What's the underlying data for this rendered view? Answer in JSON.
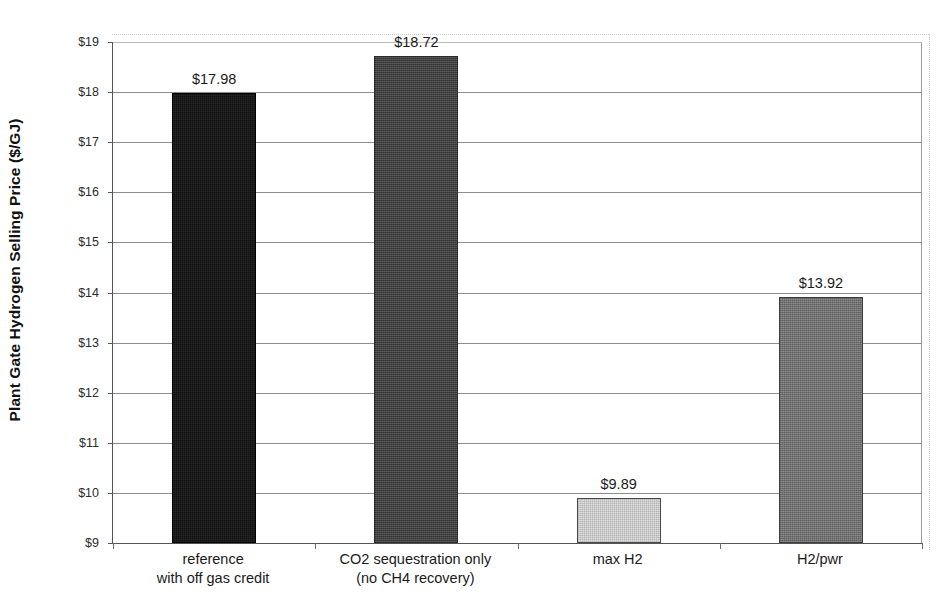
{
  "chart_data": {
    "type": "bar",
    "title": "",
    "subtitle": "",
    "xlabel": "",
    "ylabel": "Plant Gate Hydrogen Selling Price ($/GJ)",
    "categories": [
      "reference\nwith off gas credit",
      "CO2 sequestration only\n(no CH4 recovery)",
      "max H2",
      "H2/pwr"
    ],
    "values": [
      17.98,
      18.72,
      9.89,
      13.92
    ],
    "data_labels": [
      "$17.98",
      "$18.72",
      "$9.89",
      "$13.92"
    ],
    "ylim": [
      9,
      19
    ],
    "ytick_values": [
      9,
      10,
      11,
      12,
      13,
      14,
      15,
      16,
      17,
      18,
      19
    ],
    "ytick_labels": [
      "$9",
      "$10",
      "$11",
      "$12",
      "$13",
      "$14",
      "$15",
      "$16",
      "$17",
      "$18",
      "$19"
    ],
    "grid": true,
    "grid_axis": "y",
    "legend": false,
    "legend_position": "none",
    "bar_colors": [
      "#111111",
      "#3c3c3c",
      "#e0e0e0",
      "#707070"
    ],
    "bar_fill_styles": [
      "solid-darkest",
      "dither-dark",
      "dither-light",
      "dither-medium"
    ]
  },
  "axis": {
    "y_title": "Plant Gate Hydrogen Selling Price ($/GJ)"
  },
  "categories": [
    {
      "line1": "reference",
      "line2": "with off gas credit"
    },
    {
      "line1": "CO2 sequestration only",
      "line2": "(no CH4 recovery)"
    },
    {
      "line1": "max H2",
      "line2": ""
    },
    {
      "line1": "H2/pwr",
      "line2": ""
    }
  ]
}
